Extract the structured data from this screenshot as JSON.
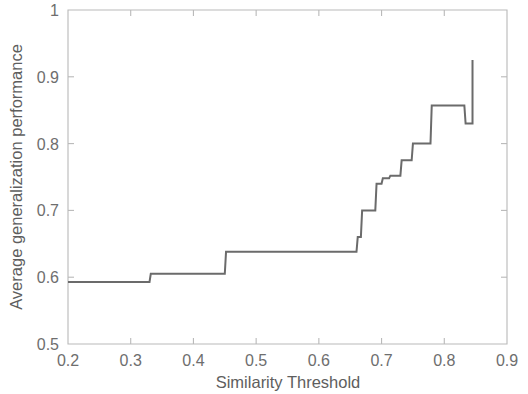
{
  "chart_data": {
    "type": "line",
    "title": "",
    "xlabel": "Similarity Threshold",
    "ylabel": "Average generalization performance",
    "xlim": [
      0.2,
      0.9
    ],
    "ylim": [
      0.5,
      1.0
    ],
    "xticks": [
      0.2,
      0.3,
      0.4,
      0.5,
      0.6,
      0.7,
      0.8,
      0.9
    ],
    "xtick_labels": [
      "0.2",
      "0.3",
      "0.4",
      "0.5",
      "0.6",
      "0.7",
      "0.8",
      "0.9"
    ],
    "yticks": [
      0.5,
      0.6,
      0.7,
      0.8,
      0.9,
      1.0
    ],
    "ytick_labels": [
      "0.5",
      "0.6",
      "0.7",
      "0.8",
      "0.9",
      "1"
    ],
    "grid": false,
    "legend": null,
    "drawstyle": "steps-post",
    "line_color": "#6b6b6b",
    "series": [
      {
        "name": "Average generalization performance",
        "x": [
          0.2,
          0.33,
          0.332,
          0.45,
          0.452,
          0.66,
          0.662,
          0.667,
          0.669,
          0.69,
          0.692,
          0.7,
          0.702,
          0.712,
          0.714,
          0.73,
          0.732,
          0.748,
          0.75,
          0.778,
          0.78,
          0.832,
          0.834,
          0.845
        ],
        "y": [
          0.593,
          0.593,
          0.605,
          0.605,
          0.638,
          0.638,
          0.66,
          0.66,
          0.7,
          0.7,
          0.74,
          0.74,
          0.748,
          0.748,
          0.752,
          0.752,
          0.775,
          0.775,
          0.8,
          0.8,
          0.857,
          0.857,
          0.83,
          0.83
        ],
        "final_spike": {
          "x": 0.845,
          "y_from": 0.83,
          "y_to": 0.925
        }
      }
    ],
    "annotations": []
  },
  "figure": {
    "background_color": "#ffffff",
    "axis_color": "#b9b9b9",
    "text_color": "#6e6e6e"
  }
}
